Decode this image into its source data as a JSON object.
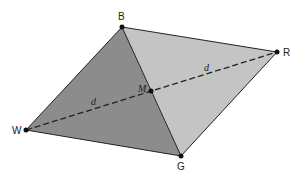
{
  "diagram": {
    "type": "rhombus",
    "colors": {
      "dark": "#8c8c8c",
      "light": "#c4c4c4",
      "stroke": "#222222"
    },
    "points": {
      "B": {
        "label": "B"
      },
      "R": {
        "label": "R"
      },
      "G": {
        "label": "G"
      },
      "W": {
        "label": "W"
      },
      "M": {
        "label": "M"
      }
    },
    "diagonal_labels": {
      "left": "d",
      "right": "d"
    }
  }
}
